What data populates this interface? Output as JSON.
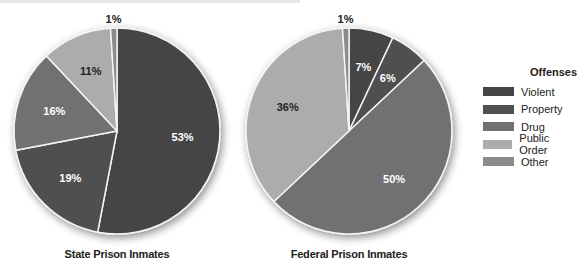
{
  "chart_data": [
    {
      "type": "pie",
      "title": "State Prison Inmates",
      "categories": [
        "Violent",
        "Property",
        "Drug",
        "Public Order",
        "Other"
      ],
      "values": [
        53,
        19,
        16,
        11,
        1
      ],
      "labels": [
        "53%",
        "19%",
        "16%",
        "11%",
        "1%"
      ],
      "start_angle": "12 o'clock, clockwise"
    },
    {
      "type": "pie",
      "title": "Federal Prison Inmates",
      "categories": [
        "Violent",
        "Property",
        "Drug",
        "Public Order",
        "Other"
      ],
      "values": [
        7,
        6,
        50,
        36,
        1
      ],
      "labels": [
        "7%",
        "6%",
        "50%",
        "36%",
        "1%"
      ],
      "start_angle": "12 o'clock, clockwise"
    }
  ],
  "legend": {
    "title": "Offenses",
    "position": "right",
    "items": [
      {
        "label": "Violent",
        "color": "#454545"
      },
      {
        "label": "Property",
        "color": "#505050"
      },
      {
        "label": "Drug",
        "color": "#717171"
      },
      {
        "label": "Public Order",
        "color": "#acacac"
      },
      {
        "label": "Other",
        "color": "#8b8b8b"
      }
    ]
  },
  "captions": {
    "state": "State Prison Inmates",
    "federal": "Federal Prison Inmates"
  },
  "pies": {
    "state": {
      "cx": 117,
      "cy": 131,
      "r": 103
    },
    "federal": {
      "cx": 349,
      "cy": 131,
      "r": 103
    }
  },
  "label_text_colors": {
    "Violent": "#ffffff",
    "Property": "#ffffff",
    "Drug": "#ffffff",
    "Public Order": "#222222",
    "Other": "#222222"
  }
}
